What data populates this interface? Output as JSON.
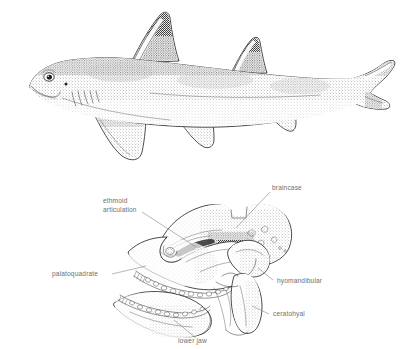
{
  "figure": {
    "background_color": "#ffffff",
    "ink_color": "#1d1d1d",
    "label_color": "#6f6f6f",
    "panels": [
      {
        "id": "upper",
        "name": "shark-body-illustration",
        "subject": "bullhead / horn shark lateral view",
        "features": [
          "blunt-head",
          "eye",
          "five-gill-slits",
          "first-dorsal-fin-with-spine",
          "second-dorsal-fin-with-spine",
          "pectoral-fin",
          "pelvic-fin",
          "anal-fin",
          "heterocercal-caudal-fin"
        ]
      },
      {
        "id": "lower",
        "name": "shark-jaw-skeleton-diagram",
        "subject": "chondrocranium with jaws and hyoid arch",
        "features": [
          "braincase",
          "palatoquadrate",
          "lower-jaw",
          "hyomandibular",
          "ceratohyal",
          "upper-tooth-row",
          "lower-tooth-row",
          "ethmoid-articulation"
        ]
      }
    ]
  },
  "labels": {
    "ethmoid_articulation_line1": "ethmoid",
    "ethmoid_articulation_line2": "articulation",
    "braincase": "braincase",
    "palatoquadrate": "palatoquadrate",
    "hyomandibular": "hyomandibular",
    "ceratohyal": "ceratohyal",
    "lower_jaw": "lower jaw"
  },
  "label_positions": {
    "ethmoid_articulation": {
      "x": 103,
      "y": 203
    },
    "braincase": {
      "x": 272,
      "y": 190
    },
    "palatoquadrate": {
      "x": 52,
      "y": 273
    },
    "hyomandibular": {
      "x": 275,
      "y": 278
    },
    "ceratohyal": {
      "x": 272,
      "y": 313
    },
    "lower_jaw": {
      "x": 198,
      "y": 341
    }
  }
}
